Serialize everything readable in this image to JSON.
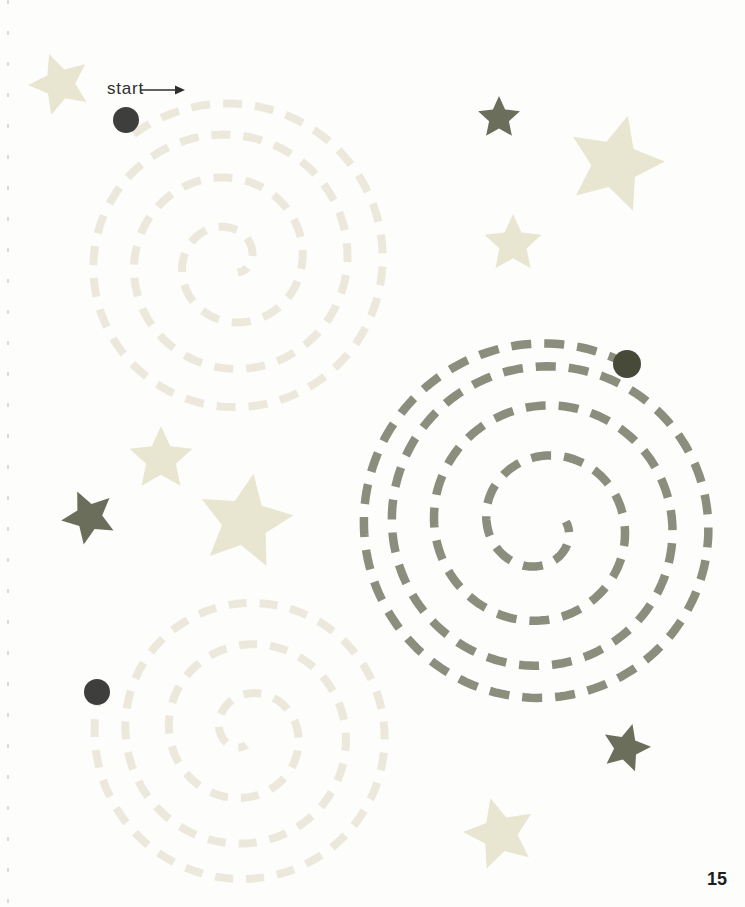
{
  "page": {
    "start_label": "start",
    "page_number": "15",
    "background": "#fdfdfc"
  },
  "colors": {
    "light_spiral": "#ece9dc",
    "light_star": "#e8e5d1",
    "olive_spiral": "#8b8d7d",
    "olive_star": "#6b6e5b",
    "dark_dot": "#3e3e3c",
    "olive_dot": "#474a39",
    "text": "#2e2e2c"
  },
  "arrow": {
    "x1": 141,
    "y1": 90,
    "x2": 176,
    "y2": 90,
    "head_length": 9,
    "head_width": 9,
    "stroke_width": 1.4
  },
  "star_inner_ratio": 0.475,
  "spirals": [
    {
      "name": "top-left-spiral",
      "cx": 230,
      "cy": 262,
      "r_start": 160,
      "r_end": 13,
      "turns": 3.5,
      "theta0": -127,
      "dir": 1,
      "ease": 1.3,
      "color_key": "light_spiral",
      "stroke_width": 8,
      "dash": "19 13",
      "dot": {
        "x": 126,
        "y": 120,
        "r": 13,
        "color_key": "dark_dot"
      }
    },
    {
      "name": "right-spiral",
      "cx": 542,
      "cy": 525,
      "r_start": 182,
      "r_end": 24,
      "turns": 3.85,
      "theta0": -62.2,
      "dir": -1,
      "ease": 1.5,
      "color_key": "olive_spiral",
      "stroke_width": 8.5,
      "dash": "20 13",
      "dot": {
        "x": 627,
        "y": 364,
        "r": 14,
        "color_key": "olive_dot"
      }
    },
    {
      "name": "bottom-left-spiral",
      "cx": 246,
      "cy": 733,
      "r_start": 152,
      "r_end": 12,
      "turns": 3.3,
      "theta0": -163,
      "dir": -1,
      "ease": 1.3,
      "color_key": "light_spiral",
      "stroke_width": 8,
      "dash": "18 13",
      "dot": {
        "x": 97,
        "y": 692,
        "r": 13,
        "color_key": "dark_dot"
      }
    }
  ],
  "stars": [
    {
      "name": "star-light-top-left-corner",
      "cx": 60,
      "cy": 84,
      "r": 32,
      "rot": -20,
      "color_key": "light_star"
    },
    {
      "name": "star-olive-top",
      "cx": 499,
      "cy": 118,
      "r": 22,
      "rot": 0,
      "color_key": "olive_star"
    },
    {
      "name": "star-light-big-top-right",
      "cx": 615,
      "cy": 164,
      "r": 50,
      "rot": 15,
      "color_key": "light_star"
    },
    {
      "name": "star-light-upper-middle",
      "cx": 513,
      "cy": 244,
      "r": 30,
      "rot": 0,
      "color_key": "light_star"
    },
    {
      "name": "star-light-mid-left",
      "cx": 161,
      "cy": 459,
      "r": 33,
      "rot": 0,
      "color_key": "light_star"
    },
    {
      "name": "star-olive-mid-left",
      "cx": 89,
      "cy": 517,
      "r": 28,
      "rot": -25,
      "color_key": "olive_star"
    },
    {
      "name": "star-light-big-middle",
      "cx": 245,
      "cy": 522,
      "r": 49,
      "rot": 10,
      "color_key": "light_star"
    },
    {
      "name": "star-olive-bottom-right",
      "cx": 626,
      "cy": 748,
      "r": 25,
      "rot": 15,
      "color_key": "olive_star"
    },
    {
      "name": "star-light-bottom",
      "cx": 500,
      "cy": 834,
      "r": 37,
      "rot": -15,
      "color_key": "light_star"
    }
  ]
}
